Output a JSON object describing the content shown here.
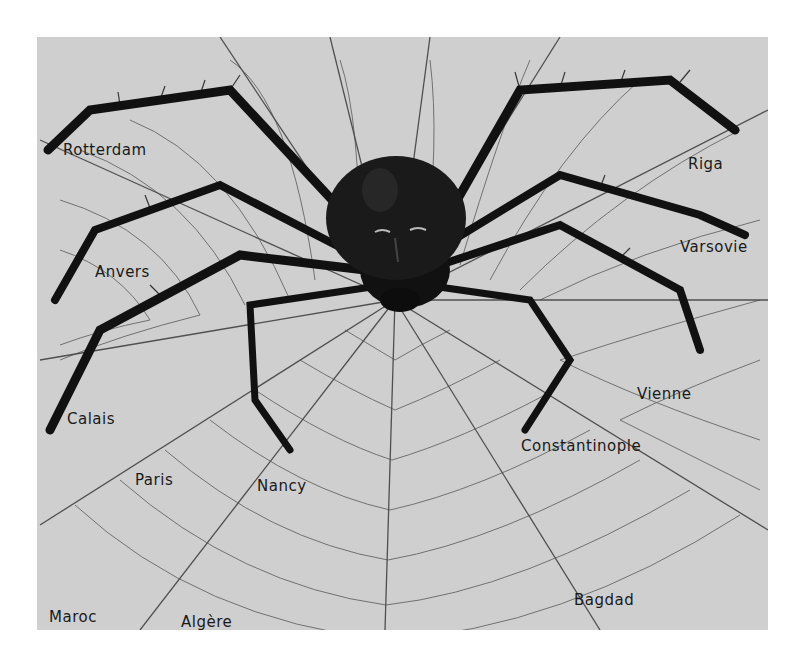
{
  "artwork": {
    "subject": "Spider with a human face at the center of a web spanning Europe and the Near East",
    "background_color": "#cfcfcf",
    "ink_color": "#141414",
    "labels": [
      {
        "id": "rotterdam",
        "text": "Rotterdam"
      },
      {
        "id": "anvers",
        "text": "Anvers"
      },
      {
        "id": "calais",
        "text": "Calais"
      },
      {
        "id": "paris",
        "text": "Paris"
      },
      {
        "id": "nancy",
        "text": "Nancy"
      },
      {
        "id": "maroc",
        "text": "Maroc"
      },
      {
        "id": "algere",
        "text": "Algère"
      },
      {
        "id": "riga",
        "text": "Riga"
      },
      {
        "id": "varsovie",
        "text": "Varsovie"
      },
      {
        "id": "vienne",
        "text": "Vienne"
      },
      {
        "id": "constantinople",
        "text": "Constantinople"
      },
      {
        "id": "bagdad",
        "text": "Bagdad"
      }
    ]
  }
}
